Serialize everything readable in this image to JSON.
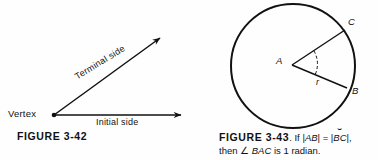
{
  "page": {
    "background": "#fefefe",
    "ink": "#111111"
  },
  "figure_left": {
    "id": "figure-3-42",
    "caption": "FIGURE  3-42",
    "labels": {
      "vertex": "Vertex",
      "initial_side": "Initial side",
      "terminal_side": "Terminal side"
    },
    "geometry": {
      "vertex_point": [
        54,
        115
      ],
      "initial_arrow_tip": [
        189,
        115
      ],
      "terminal_arrow_tip": [
        166,
        31
      ],
      "terminal_angle_deg": -31.5
    }
  },
  "figure_right": {
    "id": "figure-3-43",
    "caption_figure_word": "FIGURE  3-43",
    "caption_line1_rest": ". If |AB| = |BC|,",
    "caption_line1_prefix": ". If |",
    "caption_line1_ab": "AB",
    "caption_line1_mid": "| = |",
    "caption_line1_bc": "BC",
    "caption_line1_suffix": "|,",
    "caption_line2_prefix": "then ",
    "caption_line2_angle": "∠",
    "caption_line2_bac": " BAC",
    "caption_line2_suffix": " is 1 radian.",
    "caption_full": "FIGURE 3-43. If |AB| = |BC|, then ∠ BAC is 1 radian.",
    "labels": {
      "center": "A",
      "point_b": "B",
      "point_c": "C",
      "radius": "r"
    },
    "geometry": {
      "circle_center": [
        293,
        66
      ],
      "circle_radius": 62,
      "point_a": [
        292,
        65
      ],
      "point_b": [
        349,
        89
      ],
      "point_c": [
        347,
        26
      ],
      "angle_arc_marker": "dashed"
    }
  }
}
